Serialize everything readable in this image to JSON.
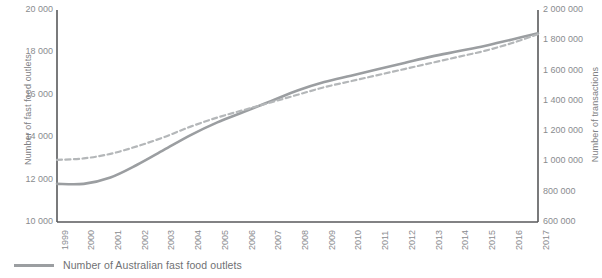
{
  "chart_data": {
    "type": "line",
    "title": "",
    "xlabel": "",
    "ylabel": "Number of fast food outlets",
    "y2label": "Number of transactions",
    "grid": false,
    "legend_position": "bottom-left",
    "x": [
      1999,
      2000,
      2001,
      2002,
      2003,
      2004,
      2005,
      2006,
      2007,
      2008,
      2009,
      2010,
      2011,
      2012,
      2013,
      2014,
      2015,
      2016,
      2017
    ],
    "categories": [
      "1999",
      "2000",
      "2001",
      "2002",
      "2003",
      "2004",
      "2005",
      "2006",
      "2007",
      "2008",
      "2009",
      "2010",
      "2011",
      "2012",
      "2013",
      "2014",
      "2015",
      "2016",
      "2017"
    ],
    "ylim": [
      10000,
      20000
    ],
    "yticks": [
      10000,
      12000,
      14000,
      16000,
      18000,
      20000
    ],
    "ytick_labels": [
      "10 000",
      "12 000",
      "14 000",
      "16 000",
      "18 000",
      "20 000"
    ],
    "y2lim": [
      600000,
      2000000
    ],
    "y2ticks": [
      600000,
      800000,
      1000000,
      1200000,
      1400000,
      1600000,
      1800000,
      2000000
    ],
    "y2tick_labels": [
      "600 000",
      "800 000",
      "1 000 000",
      "1 200 000",
      "1 400 000",
      "1 600 000",
      "1 800 000",
      "2 000 000"
    ],
    "series": [
      {
        "name": "Number of Australian fast food outlets",
        "axis": "left",
        "style": "solid",
        "color": "#9b9ea1",
        "values": [
          11800,
          11800,
          12100,
          12700,
          13400,
          14100,
          14700,
          15200,
          15700,
          16200,
          16600,
          16900,
          17200,
          17500,
          17800,
          18050,
          18300,
          18600,
          18900
        ]
      },
      {
        "name": "",
        "axis": "right",
        "style": "dashed",
        "color": "#b4b7b9",
        "values": [
          1010000,
          1020000,
          1050000,
          1100000,
          1160000,
          1230000,
          1290000,
          1340000,
          1390000,
          1440000,
          1490000,
          1530000,
          1570000,
          1610000,
          1650000,
          1690000,
          1730000,
          1780000,
          1840000
        ]
      }
    ]
  },
  "legend": {
    "items": [
      {
        "label": "Number of Australian fast food outlets",
        "style": "solid",
        "color": "#9b9ea1"
      }
    ]
  },
  "axes": {
    "left_title": "Number of fast food outlets",
    "right_title": "Number of transactions"
  },
  "colors": {
    "axis_line": "#58595b",
    "tick_text": "#8a8c8f",
    "series_solid": "#9b9ea1",
    "series_dashed": "#b4b7b9",
    "background": "#ffffff"
  }
}
